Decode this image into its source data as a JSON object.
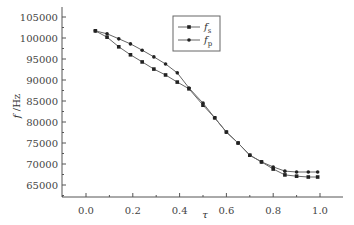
{
  "chart_data": {
    "type": "line",
    "title": "",
    "xlabel": "τ",
    "ylabel": "f /Hz",
    "xlim": [
      -0.1,
      1.1
    ],
    "ylim": [
      62200,
      107300
    ],
    "grid": false,
    "legend_position": "upper center-right (boxed)",
    "xticks": [
      0.0,
      0.2,
      0.4,
      0.6,
      0.8,
      1.0
    ],
    "xtick_labels": [
      "0.0",
      "0.2",
      "0.4",
      "0.6",
      "0.8",
      "1.0"
    ],
    "yticks": [
      65000,
      70000,
      75000,
      80000,
      85000,
      90000,
      95000,
      100000,
      105000
    ],
    "ytick_labels": [
      "65000",
      "70000",
      "75000",
      "80000",
      "85000",
      "90000",
      "95000",
      "100000",
      "105000"
    ],
    "x": [
      0.04,
      0.09,
      0.14,
      0.19,
      0.24,
      0.29,
      0.34,
      0.39,
      0.44,
      0.5,
      0.55,
      0.6,
      0.65,
      0.7,
      0.75,
      0.8,
      0.85,
      0.9,
      0.95,
      0.99
    ],
    "series": [
      {
        "name": "f_s",
        "label_main": "f",
        "label_sub": "s",
        "marker": "square",
        "color": "#222222",
        "values": [
          101700,
          100200,
          97900,
          96000,
          94300,
          92600,
          91200,
          89500,
          87900,
          84000,
          81000,
          77600,
          75000,
          72100,
          70500,
          68800,
          67400,
          67100,
          66900,
          66900
        ]
      },
      {
        "name": "f_p",
        "label_main": "f",
        "label_sub": "p",
        "marker": "dot",
        "color": "#222222",
        "values": [
          101700,
          101000,
          99800,
          98600,
          97100,
          95500,
          93800,
          91700,
          88100,
          84500,
          81000,
          77600,
          75000,
          72100,
          70500,
          69300,
          68300,
          68100,
          68100,
          68100
        ]
      }
    ]
  },
  "axes": {
    "x_title": "τ",
    "y_title_main": "f",
    "y_title_unit": " /Hz"
  },
  "legend": {
    "items": [
      {
        "main": "f",
        "sub": "s"
      },
      {
        "main": "f",
        "sub": "p"
      }
    ]
  }
}
